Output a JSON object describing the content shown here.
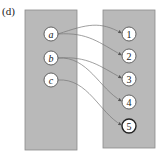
{
  "diagram": {
    "label": "(d)",
    "domain_set": {
      "nodes": [
        {
          "id": "a",
          "label": "a"
        },
        {
          "id": "b",
          "label": "b"
        },
        {
          "id": "c",
          "label": "c"
        }
      ]
    },
    "codomain_set": {
      "nodes": [
        {
          "id": "1",
          "label": "1"
        },
        {
          "id": "2",
          "label": "2"
        },
        {
          "id": "3",
          "label": "3"
        },
        {
          "id": "4",
          "label": "4"
        },
        {
          "id": "5",
          "label": "5",
          "emphasized": true
        }
      ]
    },
    "mappings": [
      {
        "from": "a",
        "to": "1"
      },
      {
        "from": "a",
        "to": "2"
      },
      {
        "from": "b",
        "to": "3"
      },
      {
        "from": "b",
        "to": "4"
      },
      {
        "from": "c",
        "to": "5"
      }
    ],
    "colors": {
      "panel": "#b9b9b9",
      "node_fill": "#ffffff",
      "edge": "#777777"
    }
  }
}
